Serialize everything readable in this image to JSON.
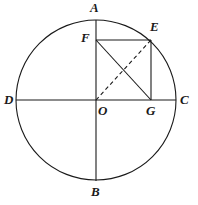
{
  "figure": {
    "width": 198,
    "height": 205,
    "background_color": "#ffffff",
    "stroke_color": "#1a1a1a"
  },
  "circle": {
    "name": "main-circle",
    "center_x": 96,
    "center_y": 100,
    "radius": 80,
    "stroke_width": 1.1
  },
  "points": {
    "A": {
      "label": "A",
      "x": 96,
      "y": 20,
      "label_x": 90,
      "label_y": 1
    },
    "B": {
      "label": "B",
      "x": 96,
      "y": 180,
      "label_x": 91,
      "label_y": 185
    },
    "C": {
      "label": "C",
      "x": 176,
      "y": 100,
      "label_x": 180,
      "label_y": 93
    },
    "D": {
      "label": "D",
      "x": 16,
      "y": 100,
      "label_x": 4,
      "label_y": 93
    },
    "E": {
      "label": "E",
      "x": 151,
      "y": 40,
      "label_x": 150,
      "label_y": 20
    },
    "F": {
      "label": "F",
      "x": 96,
      "y": 40,
      "label_x": 81,
      "label_y": 31
    },
    "G": {
      "label": "G",
      "x": 151,
      "y": 100,
      "label_x": 146,
      "label_y": 104
    },
    "O": {
      "label": "O",
      "x": 96,
      "y": 100,
      "label_x": 98,
      "label_y": 104
    }
  },
  "segments": [
    {
      "name": "vertical-diameter-AB",
      "from": "A",
      "to": "B",
      "style": "solid"
    },
    {
      "name": "horizontal-diameter-DC",
      "from": "D",
      "to": "C",
      "style": "solid"
    },
    {
      "name": "segment-FE",
      "from": "F",
      "to": "E",
      "style": "solid"
    },
    {
      "name": "segment-EG",
      "from": "E",
      "to": "G",
      "style": "solid"
    },
    {
      "name": "diagonal-FG",
      "from": "F",
      "to": "G",
      "style": "solid"
    },
    {
      "name": "diagonal-OE",
      "from": "O",
      "to": "E",
      "style": "dashed"
    }
  ],
  "dash_pattern": "4 3"
}
